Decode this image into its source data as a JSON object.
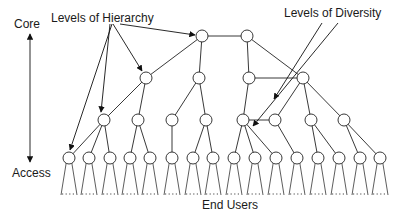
{
  "labels": {
    "core": "Core",
    "access": "Access",
    "levels_of_hierarchy": "Levels of Hierarchy",
    "levels_of_diversity": "Levels of Diversity",
    "end_users": "End Users"
  },
  "colors": {
    "line": "#222222",
    "node_fill": "#ffffff",
    "background": "#ffffff"
  },
  "tree": {
    "node_radius": 6,
    "levels": [
      {
        "name": "core",
        "y": 36,
        "nodes": [
          202,
          247
        ]
      },
      {
        "name": "level-2",
        "y": 78,
        "nodes": [
          146,
          199,
          249,
          303
        ]
      },
      {
        "name": "level-3",
        "y": 120,
        "nodes": [
          104,
          138,
          172,
          206,
          243,
          275,
          311,
          344
        ]
      },
      {
        "name": "access",
        "y": 158,
        "nodes": [
          69,
          89,
          110,
          130,
          150,
          172,
          193,
          213,
          234,
          255,
          276,
          297,
          318,
          339,
          360,
          380
        ]
      }
    ],
    "edges": [
      [
        [
          0,
          0
        ],
        [
          0,
          1
        ]
      ],
      [
        [
          0,
          0
        ],
        [
          1,
          0
        ]
      ],
      [
        [
          0,
          0
        ],
        [
          1,
          1
        ]
      ],
      [
        [
          0,
          1
        ],
        [
          1,
          2
        ]
      ],
      [
        [
          0,
          1
        ],
        [
          1,
          3
        ]
      ],
      [
        [
          1,
          0
        ],
        [
          2,
          0
        ]
      ],
      [
        [
          1,
          0
        ],
        [
          2,
          1
        ]
      ],
      [
        [
          1,
          1
        ],
        [
          2,
          2
        ]
      ],
      [
        [
          1,
          1
        ],
        [
          2,
          3
        ]
      ],
      [
        [
          1,
          2
        ],
        [
          2,
          4
        ]
      ],
      [
        [
          1,
          2
        ],
        [
          1,
          3
        ]
      ],
      [
        [
          1,
          3
        ],
        [
          2,
          5
        ]
      ],
      [
        [
          1,
          3
        ],
        [
          2,
          6
        ]
      ],
      [
        [
          1,
          3
        ],
        [
          2,
          7
        ]
      ],
      [
        [
          2,
          4
        ],
        [
          2,
          5
        ]
      ],
      [
        [
          2,
          0
        ],
        [
          3,
          0
        ]
      ],
      [
        [
          2,
          0
        ],
        [
          3,
          1
        ]
      ],
      [
        [
          2,
          0
        ],
        [
          3,
          2
        ]
      ],
      [
        [
          2,
          1
        ],
        [
          3,
          3
        ]
      ],
      [
        [
          2,
          1
        ],
        [
          3,
          4
        ]
      ],
      [
        [
          2,
          2
        ],
        [
          3,
          5
        ]
      ],
      [
        [
          2,
          3
        ],
        [
          3,
          6
        ]
      ],
      [
        [
          2,
          3
        ],
        [
          3,
          7
        ]
      ],
      [
        [
          2,
          4
        ],
        [
          3,
          8
        ]
      ],
      [
        [
          2,
          4
        ],
        [
          3,
          9
        ]
      ],
      [
        [
          2,
          4
        ],
        [
          3,
          10
        ]
      ],
      [
        [
          2,
          5
        ],
        [
          3,
          11
        ]
      ],
      [
        [
          2,
          6
        ],
        [
          3,
          12
        ]
      ],
      [
        [
          2,
          6
        ],
        [
          3,
          13
        ]
      ],
      [
        [
          2,
          7
        ],
        [
          3,
          14
        ]
      ],
      [
        [
          2,
          7
        ],
        [
          3,
          15
        ]
      ]
    ],
    "fan": {
      "y_bottom": 195,
      "half_width": 8
    }
  },
  "annotations": {
    "hierarchy_pointers": [
      {
        "from": [
          112,
          24
        ],
        "to": [
          70,
          150
        ]
      },
      {
        "from": [
          110,
          24
        ],
        "to": [
          101,
          112
        ]
      },
      {
        "from": [
          113,
          24
        ],
        "to": [
          142,
          71
        ]
      },
      {
        "from": [
          120,
          24
        ],
        "to": [
          195,
          35
        ]
      }
    ],
    "diversity_pointers": [
      {
        "from": [
          322,
          23
        ],
        "to": [
          274,
          99
        ]
      },
      {
        "from": [
          338,
          23
        ],
        "to": [
          253,
          126
        ]
      }
    ],
    "diversity_parallel_lines": [
      {
        "from": [
          335,
          22
        ],
        "to": [
          270,
          113
        ]
      },
      {
        "from": [
          347,
          22
        ],
        "to": [
          281,
          115
        ]
      }
    ],
    "core_access_axis": {
      "x": 30,
      "y_top": 34,
      "y_bottom": 162
    }
  }
}
